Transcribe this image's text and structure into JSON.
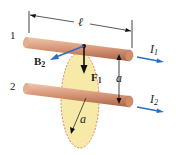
{
  "diagram": {
    "wire_labels": [
      "1",
      "2"
    ],
    "length_label": "ℓ",
    "separation_label": "a",
    "radius_label": "a",
    "current_1": {
      "symbol": "I",
      "subscript": "1"
    },
    "current_2": {
      "symbol": "I",
      "subscript": "2"
    },
    "field_label": {
      "symbol": "B",
      "subscript": "2"
    },
    "force_label": {
      "symbol": "F",
      "subscript": "1"
    },
    "colors": {
      "wire": "#d9997a",
      "wire_highlight": "#f0c7ad",
      "wire_shadow": "#b06f52",
      "arrow_blue": "#2a6fc4",
      "disk_fill": "#f7eaa8",
      "disk_edge": "#c2573a",
      "line": "#111111"
    }
  }
}
